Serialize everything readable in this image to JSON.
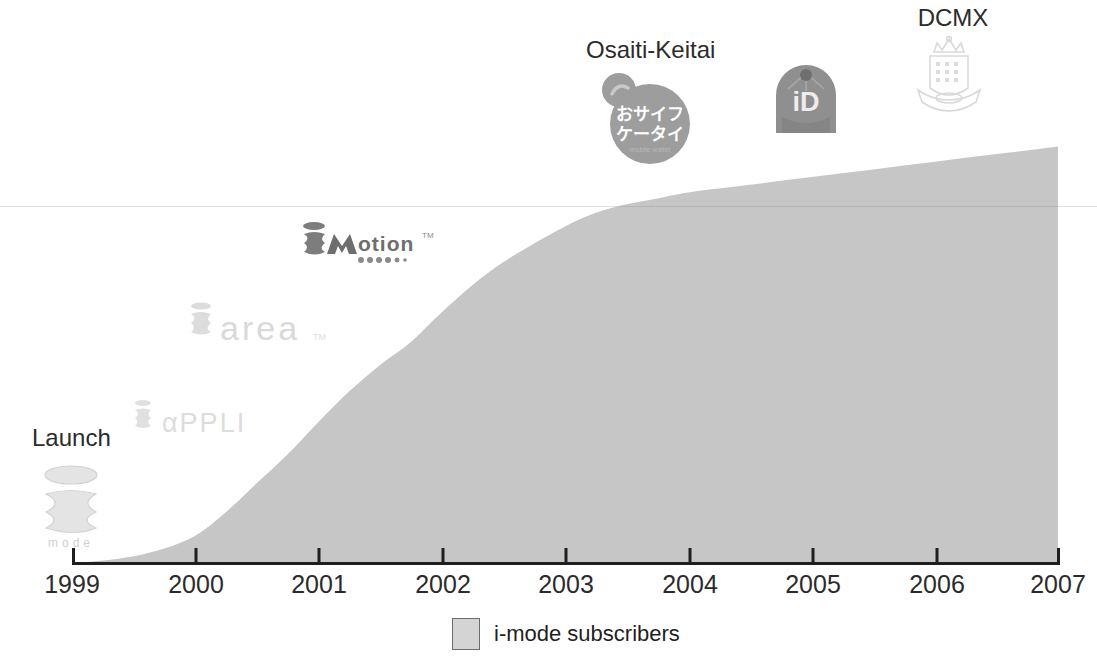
{
  "chart_data": {
    "type": "area",
    "title": "",
    "subtitle": "",
    "xlabel": "",
    "ylabel": "",
    "grid": false,
    "legend_position": "bottom-center",
    "xlim": [
      1999,
      2007
    ],
    "ylim": [
      0,
      52
    ],
    "x_tick_labels": [
      "1999",
      "2000",
      "2001",
      "2002",
      "2003",
      "2004",
      "2005",
      "2006",
      "2007"
    ],
    "y_tick_labels": [],
    "series": [
      {
        "name": "i-mode subscribers",
        "color": "#c6c6c6",
        "x": [
          1999,
          1999.25,
          1999.5,
          1999.75,
          2000,
          2000.25,
          2000.5,
          2000.75,
          2001,
          2001.25,
          2001.5,
          2001.75,
          2002,
          2002.25,
          2002.5,
          2002.75,
          2003,
          2003.25,
          2003.5,
          2003.75,
          2004,
          2004.5,
          2005,
          2005.5,
          2006,
          2006.5,
          2007
        ],
        "values": [
          0,
          0.3,
          0.8,
          1.7,
          3.2,
          6.0,
          9.4,
          12.8,
          16.6,
          20.2,
          23.3,
          26.0,
          29.5,
          32.7,
          35.4,
          37.6,
          39.6,
          41.2,
          42.2,
          42.9,
          43.6,
          44.5,
          45.4,
          46.3,
          47.2,
          48.1,
          49.0
        ]
      }
    ],
    "annotations": [
      {
        "id": "launch",
        "caption": "Launch",
        "logo": "i-mode-logo",
        "x_year": 1999.1,
        "logo_alt": "i-mode"
      },
      {
        "id": "iappli",
        "caption": "",
        "logo": "i-appli-logo",
        "x_year": 1999.6,
        "logo_alt": "i-appli"
      },
      {
        "id": "iarea",
        "caption": "",
        "logo": "i-area-logo",
        "x_year": 2000.1,
        "logo_alt": "i-area"
      },
      {
        "id": "imotion",
        "caption": "",
        "logo": "i-motion-logo",
        "x_year": 2001.0,
        "logo_alt": "i-motion"
      },
      {
        "id": "osaifu",
        "caption": "Osaiti-Keitai",
        "logo": "osaifu-keitai-logo",
        "x_year": 2003.2,
        "logo_alt": "おサイフケータイ"
      },
      {
        "id": "id",
        "caption": "",
        "logo": "id-logo",
        "x_year": 2004.6,
        "logo_alt": "iD"
      },
      {
        "id": "dcmx",
        "caption": "DCMX",
        "logo": "dcmx-logo",
        "x_year": 2005.6,
        "logo_alt": "DCMX"
      }
    ]
  },
  "axis": {
    "ticks": [
      {
        "label": "1999",
        "px": 72
      },
      {
        "label": "2000",
        "px": 196
      },
      {
        "label": "2001",
        "px": 319
      },
      {
        "label": "2002",
        "px": 443
      },
      {
        "label": "2003",
        "px": 566
      },
      {
        "label": "2004",
        "px": 690
      },
      {
        "label": "2005",
        "px": 813
      },
      {
        "label": "2006",
        "px": 937
      },
      {
        "label": "2007",
        "px": 1060
      }
    ],
    "axis_color": "#1f1f1f"
  },
  "legend": {
    "label": "i-mode subscribers",
    "swatch_fill": "#d4d4d4",
    "swatch_border": "#6d6d6d"
  },
  "annotations": {
    "launch": {
      "caption": "Launch",
      "logo_name": "i-mode-logo",
      "logo_wordmark": "mode"
    },
    "iappli": {
      "caption": "",
      "logo_name": "i-appli-logo",
      "logo_wordmark": "αPPLI"
    },
    "iarea": {
      "caption": "",
      "logo_name": "i-area-logo",
      "logo_wordmark": "area"
    },
    "imotion": {
      "caption": "",
      "logo_name": "i-motion-logo",
      "logo_wordmark": "otion"
    },
    "osaifu": {
      "caption": "Osaiti-Keitai",
      "logo_name": "osaifu-keitai-logo",
      "logo_line1": "おサイフ",
      "logo_line2": "ケータイ"
    },
    "id": {
      "caption": "",
      "logo_name": "id-logo",
      "logo_wordmark": "iD"
    },
    "dcmx": {
      "caption": "DCMX",
      "logo_name": "dcmx-logo",
      "logo_wordmark": ""
    }
  },
  "colors": {
    "area_fill": "#c6c6c6",
    "axis": "#1f1f1f",
    "text": "#2b2b2b",
    "logo_pale": "#e2e2e2",
    "logo_mid": "#b9b9b9",
    "logo_dark": "#6e6e6e"
  }
}
